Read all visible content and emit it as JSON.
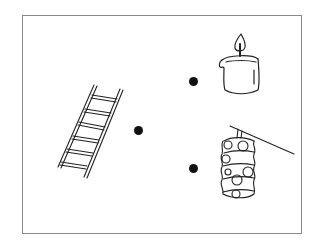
{
  "worksheet": {
    "type": "matching-exercise",
    "items_left": [
      {
        "name": "ladder",
        "icon": "ladder-icon"
      }
    ],
    "items_right": [
      {
        "name": "candle",
        "icon": "candle-icon"
      },
      {
        "name": "paper lantern",
        "icon": "lantern-icon"
      }
    ],
    "dots": [
      {
        "id": "ladder-dot",
        "x": 138,
        "y": 130
      },
      {
        "id": "candle-dot",
        "x": 193,
        "y": 81
      },
      {
        "id": "lantern-dot",
        "x": 193,
        "y": 168
      }
    ],
    "colors": {
      "border": "#8a8a8a",
      "ink": "#111111",
      "background": "#ffffff"
    }
  }
}
